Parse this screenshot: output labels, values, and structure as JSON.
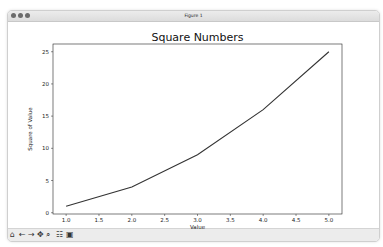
{
  "window": {
    "title": "Figure 1"
  },
  "toolbar": {
    "buttons": [
      {
        "name": "home",
        "glyph": "⌂"
      },
      {
        "name": "back",
        "glyph": "←"
      },
      {
        "name": "forward",
        "glyph": "→"
      },
      {
        "name": "pan",
        "glyph": "✥"
      },
      {
        "name": "zoom",
        "glyph": "⌕"
      },
      {
        "name": "configure",
        "glyph": "☷"
      },
      {
        "name": "save",
        "glyph": "▣"
      }
    ]
  },
  "chart_data": {
    "type": "line",
    "title": "Square Numbers",
    "xlabel": "Value",
    "ylabel": "Square of Value",
    "x": [
      1,
      2,
      3,
      4,
      5
    ],
    "series": [
      {
        "name": "squares",
        "values": [
          1,
          4,
          9,
          16,
          25
        ],
        "color": "#333333"
      }
    ],
    "xlim": [
      0.8,
      5.2
    ],
    "ylim": [
      -0.2,
      26.2
    ],
    "xticks": [
      "1.0",
      "1.5",
      "2.0",
      "2.5",
      "3.0",
      "3.5",
      "4.0",
      "4.5",
      "5.0"
    ],
    "yticks": [
      "0",
      "5",
      "10",
      "15",
      "20",
      "25"
    ],
    "grid": false
  }
}
